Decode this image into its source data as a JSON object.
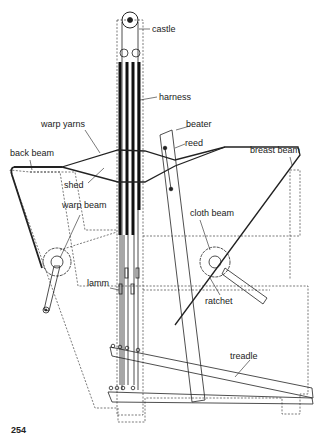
{
  "figure": {
    "page_number": "254",
    "labels": {
      "castle": "castle",
      "harness": "harness",
      "warp_yarns": "warp yarns",
      "beater": "beater",
      "reed": "reed",
      "back_beam": "back beam",
      "breast_beam": "breast beam",
      "shed": "shed",
      "warp_beam": "warp beam",
      "cloth_beam": "cloth beam",
      "lamm": "lamm",
      "ratchet": "ratchet",
      "treadle": "treadle"
    }
  }
}
